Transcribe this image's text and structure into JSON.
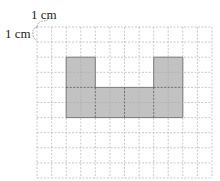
{
  "labels": {
    "top_unit": "1 cm",
    "left_unit": "1 cm"
  },
  "grid": {
    "columns": 12,
    "rows": 10,
    "cell_size_label": "1 cm",
    "line_color": "#bbbbbb"
  },
  "shape": {
    "fill": "#c0c0c0",
    "stroke": "#777777",
    "description": "U-shaped figure: two 2x2 towers on top of a 8x2 base",
    "cells_total": 24
  }
}
